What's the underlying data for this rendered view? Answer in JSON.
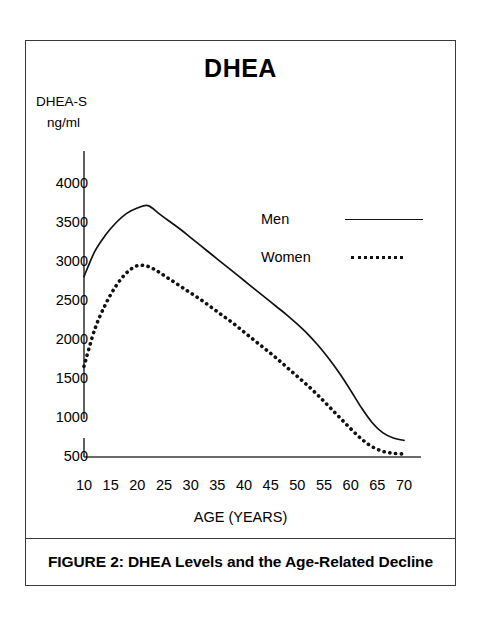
{
  "figure": {
    "title": "DHEA",
    "caption": "FIGURE 2: DHEA Levels and the Age-Related Decline",
    "y_unit_line1": "DHEA-S",
    "y_unit_line2": "ng/ml"
  },
  "legend": {
    "men_label": "Men",
    "women_label": "Women"
  },
  "chart_data": {
    "type": "line",
    "title": "DHEA",
    "xlabel": "AGE (YEARS)",
    "ylabel": "DHEA-S ng/ml",
    "xlim": [
      10,
      70
    ],
    "ylim": [
      500,
      4100
    ],
    "xticks": [
      10,
      15,
      20,
      25,
      30,
      35,
      40,
      45,
      50,
      55,
      60,
      65,
      70
    ],
    "yticks": [
      500,
      1000,
      1500,
      2000,
      2500,
      3000,
      3500,
      4000
    ],
    "grid": false,
    "legend_position": "inside-upper-right",
    "x": [
      10,
      12,
      14,
      16,
      18,
      20,
      22,
      24,
      26,
      28,
      30,
      32,
      34,
      36,
      38,
      40,
      42,
      44,
      46,
      48,
      50,
      52,
      54,
      56,
      58,
      60,
      62,
      64,
      66,
      68,
      70
    ],
    "series": [
      {
        "name": "Men",
        "style": "solid",
        "color": "#111111",
        "values": [
          2800,
          3120,
          3330,
          3490,
          3610,
          3680,
          3710,
          3610,
          3510,
          3410,
          3300,
          3190,
          3080,
          2970,
          2860,
          2750,
          2640,
          2530,
          2420,
          2310,
          2190,
          2060,
          1910,
          1740,
          1550,
          1340,
          1120,
          930,
          800,
          730,
          700
        ]
      },
      {
        "name": "Women",
        "style": "dotted",
        "color": "#111111",
        "values": [
          1650,
          2120,
          2440,
          2680,
          2850,
          2940,
          2930,
          2860,
          2770,
          2680,
          2590,
          2500,
          2400,
          2300,
          2200,
          2090,
          1980,
          1870,
          1760,
          1640,
          1520,
          1400,
          1270,
          1130,
          990,
          850,
          720,
          620,
          560,
          535,
          525
        ]
      }
    ]
  },
  "axes_geometry": {
    "plot_left_px": 58,
    "plot_right_px": 378,
    "baseline_y_px": 415,
    "y_top_px": 110
  }
}
